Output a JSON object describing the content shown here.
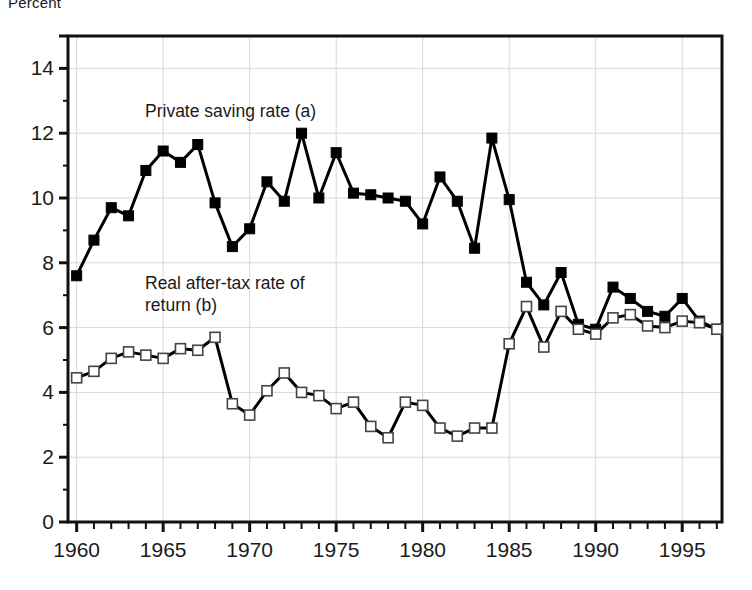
{
  "figure": {
    "unit_label": "Percent",
    "annotations": [
      {
        "name": "private-saving-rate",
        "text": "Private saving rate (a)",
        "x": 145,
        "y": 100
      },
      {
        "name": "real-after-tax-return",
        "text": "Real after-tax rate of\nreturn (b)",
        "x": 145,
        "y": 272
      }
    ]
  },
  "chart_data": {
    "type": "line",
    "title": "",
    "subtitle": "",
    "xlabel": "",
    "ylabel": "Percent",
    "xlim": [
      1959.5,
      1997.3
    ],
    "ylim": [
      0,
      15
    ],
    "yticks": [
      0,
      2,
      4,
      6,
      8,
      10,
      12,
      14
    ],
    "ytick_labels": [
      "0",
      "2",
      "4",
      "6",
      "8",
      "10",
      "12",
      "14"
    ],
    "xticks": [
      1960,
      1965,
      1970,
      1975,
      1980,
      1985,
      1990,
      1995
    ],
    "xtick_labels": [
      "1960",
      "1965",
      "1970",
      "1975",
      "1980",
      "1985",
      "1990",
      "1995"
    ],
    "x_minor_tick_step": 1,
    "grid": true,
    "grid_color": "#d8d8d8",
    "legend": "inline-annotations",
    "axis_color": "#111111",
    "x": [
      1960,
      1961,
      1962,
      1963,
      1964,
      1965,
      1966,
      1967,
      1968,
      1969,
      1970,
      1971,
      1972,
      1973,
      1974,
      1975,
      1976,
      1977,
      1978,
      1979,
      1980,
      1981,
      1982,
      1983,
      1984,
      1985,
      1986,
      1987,
      1988,
      1989,
      1990,
      1991,
      1992,
      1993,
      1994,
      1995,
      1996,
      1997
    ],
    "series": [
      {
        "name": "Private saving rate (a)",
        "marker": "filled-square",
        "color": "#000000",
        "values": [
          7.6,
          8.7,
          9.7,
          9.45,
          10.85,
          11.45,
          11.1,
          11.65,
          9.85,
          8.5,
          9.05,
          10.5,
          9.9,
          12.0,
          10.0,
          11.4,
          10.15,
          10.1,
          10.0,
          9.9,
          9.2,
          10.65,
          9.9,
          8.45,
          11.85,
          9.95,
          7.4,
          6.7,
          7.7,
          6.1,
          5.95,
          7.25,
          6.9,
          6.5,
          6.35,
          6.9,
          6.2,
          5.95
        ]
      },
      {
        "name": "Real after-tax rate of return (b)",
        "marker": "open-square",
        "color": "#000000",
        "values": [
          4.45,
          4.65,
          5.05,
          5.25,
          5.15,
          5.05,
          5.35,
          5.3,
          5.7,
          3.65,
          3.3,
          4.05,
          4.6,
          4.0,
          3.9,
          3.5,
          3.7,
          2.95,
          2.6,
          3.7,
          3.6,
          2.9,
          2.65,
          2.9,
          2.9,
          5.5,
          6.65,
          5.4,
          6.5,
          5.95,
          5.8,
          6.3,
          6.4,
          6.05,
          6.0,
          6.2,
          6.15,
          5.95
        ]
      }
    ]
  }
}
